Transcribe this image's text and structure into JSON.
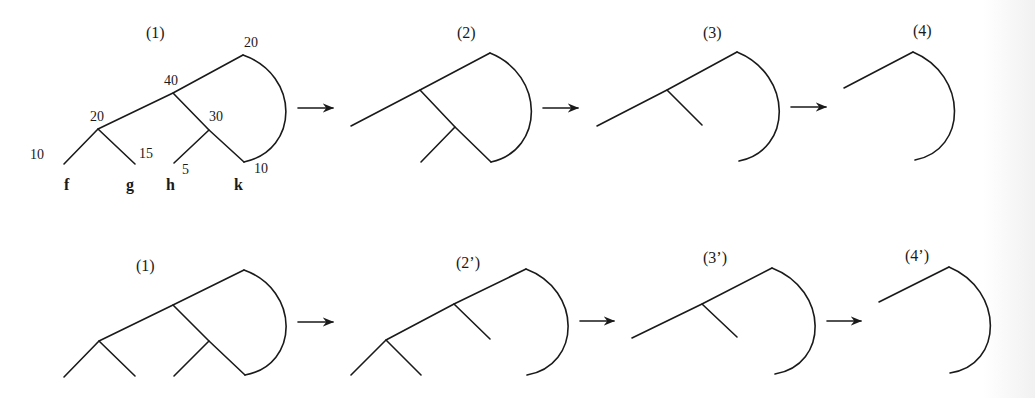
{
  "colors": {
    "ink": "#1a1a1a",
    "background": "#ffffff"
  },
  "rows": [
    {
      "name": "top-row",
      "stages": [
        {
          "label": "(1)",
          "label_pos": [
            146,
            25
          ],
          "edges": [
            "M64,164 L98,129 L173,93 L243,55",
            "M98,129 L135,164",
            "M173,93 L209,130 L244,162",
            "M209,130 L174,163",
            "M243,55 C300,75 300,150 244,162"
          ],
          "weights": [
            {
              "text": "20",
              "pos": [
                244,
                36
              ]
            },
            {
              "text": "40",
              "pos": [
                164,
                74
              ]
            },
            {
              "text": "20",
              "pos": [
                90,
                110
              ]
            },
            {
              "text": "30",
              "pos": [
                209,
                110
              ]
            },
            {
              "text": "10",
              "pos": [
                30,
                148
              ]
            },
            {
              "text": "15",
              "pos": [
                139,
                147
              ]
            },
            {
              "text": "5",
              "pos": [
                182,
                163
              ]
            },
            {
              "text": "10",
              "pos": [
                254,
                162
              ]
            }
          ],
          "leaves": [
            {
              "text": "f",
              "pos": [
                64,
                178
              ]
            },
            {
              "text": "g",
              "pos": [
                126,
                178
              ]
            },
            {
              "text": "h",
              "pos": [
                166,
                178
              ]
            },
            {
              "text": "k",
              "pos": [
                234,
                178
              ]
            }
          ]
        },
        {
          "label": "(2)",
          "label_pos": [
            457,
            25
          ],
          "edges": [
            "M351,126 L420,90 L490,53",
            "M420,90 L455,127 L491,162",
            "M455,127 L421,162",
            "M490,53 C545,75 545,150 491,162"
          ]
        },
        {
          "label": "(3)",
          "label_pos": [
            703,
            25
          ],
          "edges": [
            "M597,126 L667,90 L737,52",
            "M667,90 L702,125",
            "M737,52 C793,75 793,150 739,161"
          ]
        },
        {
          "label": "(4)",
          "label_pos": [
            913,
            23
          ],
          "edges": [
            "M844,88 L913,52",
            "M913,52 C968,75 968,150 915,160"
          ]
        }
      ],
      "arrows": [
        {
          "from": [
            298,
            108
          ],
          "to": [
            333,
            108
          ]
        },
        {
          "from": [
            543,
            108
          ],
          "to": [
            578,
            108
          ]
        },
        {
          "from": [
            791,
            107
          ],
          "to": [
            826,
            107
          ]
        }
      ]
    },
    {
      "name": "bottom-row",
      "stages": [
        {
          "label": "(1)",
          "label_pos": [
            136,
            258
          ],
          "edges": [
            "M64,377 L99,341 L173,305 L244,270",
            "M99,341 L135,376",
            "M173,305 L209,341 L245,375",
            "M209,341 L174,376",
            "M244,270 C300,290 300,365 245,375"
          ]
        },
        {
          "label": "(2’)",
          "label_pos": [
            456,
            255
          ],
          "edges": [
            "M351,375 L386,340 L454,304 L526,269",
            "M386,340 L421,375",
            "M454,304 L490,339",
            "M526,269 C582,290 582,365 527,375"
          ]
        },
        {
          "label": "(3’)",
          "label_pos": [
            703,
            250
          ],
          "edges": [
            "M632,338 L702,304 L772,268",
            "M702,304 L737,337",
            "M772,268 C829,290 829,365 775,374"
          ]
        },
        {
          "label": "(4’)",
          "label_pos": [
            905,
            248
          ],
          "edges": [
            "M879,302 L949,267",
            "M949,267 C1004,290 1004,365 950,373"
          ]
        }
      ],
      "arrows": [
        {
          "from": [
            298,
            322
          ],
          "to": [
            333,
            322
          ]
        },
        {
          "from": [
            580,
            321
          ],
          "to": [
            614,
            321
          ]
        },
        {
          "from": [
            827,
            321
          ],
          "to": [
            861,
            321
          ]
        }
      ]
    }
  ]
}
